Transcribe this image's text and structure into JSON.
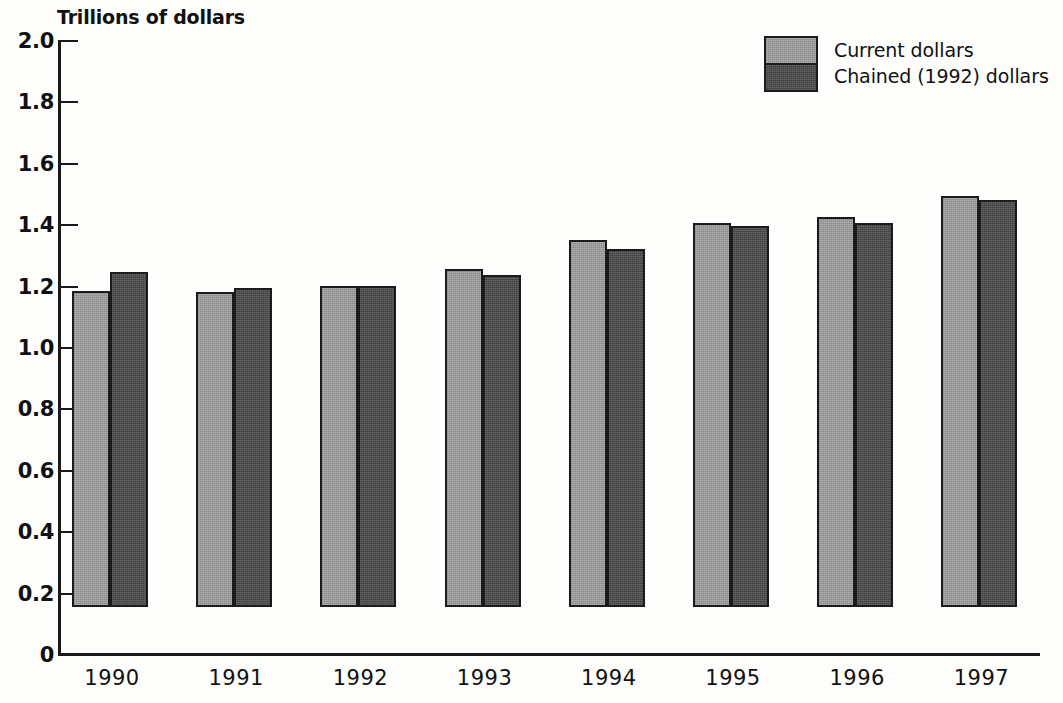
{
  "chart_data": {
    "type": "bar",
    "title": "Trillions of dollars",
    "xlabel": "",
    "ylabel": "Trillions of dollars",
    "categories": [
      "1990",
      "1991",
      "1992",
      "1993",
      "1994",
      "1995",
      "1996",
      "1997"
    ],
    "series": [
      {
        "name": "Current dollars",
        "color": "#9b9b9b",
        "values": [
          1.03,
          1.025,
          1.045,
          1.1,
          1.195,
          1.25,
          1.27,
          1.34
        ]
      },
      {
        "name": "Chained (1992) dollars",
        "color": "#3f3f3f",
        "values": [
          1.09,
          1.04,
          1.045,
          1.08,
          1.165,
          1.24,
          1.25,
          1.325
        ]
      }
    ],
    "ylim": [
      0,
      2.0
    ],
    "y_ticks": [
      "2.0",
      "1.8",
      "1.6",
      "1.4",
      "1.2",
      "1.0",
      "0.8",
      "0.6",
      "0.4",
      "0.2",
      "0"
    ],
    "y_tick_values": [
      2.0,
      1.8,
      1.6,
      1.4,
      1.2,
      1.0,
      0.8,
      0.6,
      0.4,
      0.2,
      0
    ],
    "grid": false,
    "legend_position": "top-right"
  },
  "legend": {
    "entries": [
      {
        "label": "Current dollars",
        "swatch": "light-gray-swatch"
      },
      {
        "label": "Chained (1992) dollars",
        "swatch": "dark-gray-swatch"
      }
    ]
  }
}
